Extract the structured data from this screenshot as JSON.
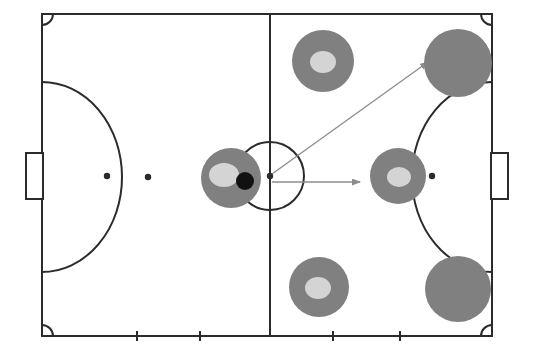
{
  "diagram": {
    "title": "Futsal tactical diagram",
    "background_color": "#ffffff",
    "line_color": "#2b2b2b",
    "player_fill": "#808080",
    "player_inner_fill": "#d4d4d4",
    "ball_fill": "#111111",
    "arrow_color": "#8c8c8c",
    "pitch": {
      "left": 42,
      "top": 14,
      "right": 492,
      "bottom": 336,
      "halfway_x": 270,
      "center_y": 176,
      "center_circle_radius": 34,
      "corner_arc_radius": 11,
      "stroke_width": 2
    },
    "goals": [
      {
        "name": "goal-left",
        "x": 26,
        "y": 153,
        "width": 17,
        "height": 46
      },
      {
        "name": "goal-right",
        "x": 491,
        "y": 153,
        "width": 17,
        "height": 46
      }
    ],
    "penalty_arcs": [
      {
        "name": "penalty-arc-left",
        "base_x": 42,
        "apex_x": 122,
        "top_y": 82,
        "bottom_y": 272
      },
      {
        "name": "penalty-arc-right",
        "base_x": 492,
        "apex_x": 412,
        "top_y": 82,
        "bottom_y": 272
      }
    ],
    "spots": [
      {
        "name": "penalty-spot-left",
        "cx": 107,
        "cy": 176,
        "r": 3.2
      },
      {
        "name": "second-spot-left",
        "cx": 148,
        "cy": 177,
        "r": 3.2
      },
      {
        "name": "center-spot",
        "cx": 270,
        "cy": 176,
        "r": 3.2
      },
      {
        "name": "penalty-spot-right",
        "cx": 432,
        "cy": 176,
        "r": 3.2
      }
    ],
    "substitution_ticks": [
      {
        "name": "tick-1",
        "x": 137
      },
      {
        "name": "tick-2",
        "x": 200
      },
      {
        "name": "tick-3",
        "x": 333
      },
      {
        "name": "tick-4",
        "x": 400
      }
    ],
    "tick_length": 10,
    "players": [
      {
        "name": "player-with-ball",
        "label": "ball carrier",
        "cx": 231,
        "cy": 178,
        "r": 30,
        "has_inner": true,
        "inner_cx": 224,
        "inner_cy": 175,
        "inner_rx": 15,
        "inner_ry": 12,
        "has_ball": true,
        "ball_cx": 245,
        "ball_cy": 181,
        "ball_r": 9
      },
      {
        "name": "player-top-left-attacker",
        "label": "top attacker",
        "cx": 323,
        "cy": 61,
        "r": 31,
        "has_inner": true,
        "inner_cx": 323,
        "inner_cy": 62,
        "inner_rx": 13,
        "inner_ry": 11,
        "has_ball": false
      },
      {
        "name": "player-top-right-defender",
        "label": "top right target",
        "cx": 458,
        "cy": 63,
        "r": 34,
        "has_inner": false,
        "has_ball": false
      },
      {
        "name": "player-middle-right-attacker",
        "label": "middle attacker",
        "cx": 398,
        "cy": 176,
        "r": 28,
        "has_inner": true,
        "inner_cx": 399,
        "inner_cy": 177,
        "inner_rx": 12,
        "inner_ry": 10,
        "has_ball": false
      },
      {
        "name": "player-bottom-left-attacker",
        "label": "bottom attacker",
        "cx": 319,
        "cy": 287,
        "r": 30,
        "has_inner": true,
        "inner_cx": 318,
        "inner_cy": 288,
        "inner_rx": 13,
        "inner_ry": 11,
        "has_ball": false
      },
      {
        "name": "player-bottom-right-defender",
        "label": "bottom right target",
        "cx": 458,
        "cy": 289,
        "r": 33,
        "has_inner": false,
        "has_ball": false
      }
    ],
    "arrows": [
      {
        "name": "arrow-diagonal-pass",
        "label": "diagonal pass up-right",
        "x1": 272,
        "y1": 174,
        "x2": 428,
        "y2": 62
      },
      {
        "name": "arrow-horizontal-pass",
        "label": "horizontal pass right",
        "x1": 272,
        "y1": 182,
        "x2": 360,
        "y2": 182
      }
    ]
  }
}
